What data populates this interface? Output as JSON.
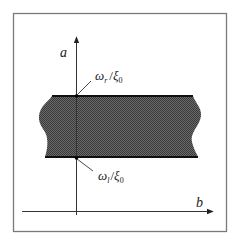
{
  "diagram": {
    "axes": {
      "vertical_label": "a",
      "horizontal_label": "b"
    },
    "band": {
      "upper_boundary_label": {
        "omega": "ω",
        "omega_sub": "r",
        "slash": "/",
        "xi": "ξ",
        "xi_sub": "0"
      },
      "lower_boundary_label": {
        "omega": "ω",
        "omega_sub": "l",
        "slash": "/",
        "xi": "ξ",
        "xi_sub": "0"
      }
    },
    "colors": {
      "frame": "#7a7a7a",
      "axis": "#333333",
      "band_fill": "#5a5a5a",
      "band_edge": "#111111"
    }
  }
}
